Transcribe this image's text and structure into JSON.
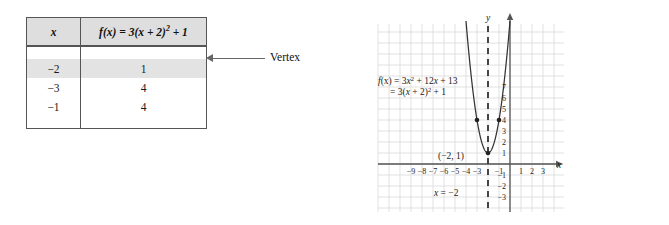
{
  "table_figure": {
    "columns": [
      {
        "label": "x",
        "italic": true
      },
      {
        "label": "f(x) = 3(x + 2)2 + 1",
        "italic": false
      }
    ],
    "header_x": "x",
    "header_fx_f": "f",
    "header_fx_paren_x": "(x)",
    "header_fx_eq": " = 3(",
    "header_fx_var": "x",
    "header_fx_tail": " + 2)",
    "header_fx_exp": "2",
    "header_fx_end": " + 1",
    "rows": [
      {
        "x": "−2",
        "fx": "1",
        "highlight": true
      },
      {
        "x": "−3",
        "fx": "4",
        "highlight": false
      },
      {
        "x": "−1",
        "fx": "4",
        "highlight": false
      }
    ]
  },
  "vertex_callout": {
    "label": "Vertex"
  },
  "chart_data": {
    "type": "line",
    "title": "",
    "xlabel": "x",
    "ylabel": "y",
    "function_label_line1_f": "f",
    "function_label_line1_px": "(x)",
    "function_label_line1_eq": " = 3",
    "function_label_line1_x": "x",
    "function_label_line1_exp": "2",
    "function_label_line1_tail": " + 12",
    "function_label_line1_x2": "x",
    "function_label_line1_end": " + 13",
    "function_label_line2_eq": "= 3(",
    "function_label_line2_x": "x",
    "function_label_line2_tail": " + 2)",
    "function_label_line2_exp": "2",
    "function_label_line2_end": " + 1",
    "equation_standard": "f(x) = 3x2 + 12x + 13",
    "equation_vertex_form": "= 3(x + 2)2 + 1",
    "axis_of_symmetry_label_x": "x",
    "axis_of_symmetry_label_eq": " = −2",
    "axis_of_symmetry_value": -2,
    "vertex_label": "(−2, 1)",
    "vertex": {
      "x": -2,
      "y": 1
    },
    "xlim": [
      -10,
      4
    ],
    "ylim": [
      -4,
      9
    ],
    "grid": true,
    "xticks": [
      -9,
      -8,
      -7,
      -6,
      -5,
      -4,
      -3,
      -1,
      1,
      2,
      3
    ],
    "xtick_labels": [
      "−9",
      "−8",
      "−7",
      "−6",
      "−5",
      "−4",
      "−3",
      "−1",
      "1",
      "2",
      "3"
    ],
    "yticks": [
      7,
      6,
      5,
      4,
      3,
      2,
      1,
      -1,
      -2,
      -3
    ],
    "ytick_labels": [
      "7",
      "6",
      "5",
      "4",
      "3",
      "2",
      "1",
      "−1",
      "−2",
      "−3"
    ],
    "points": [
      {
        "x": -3,
        "y": 4
      },
      {
        "x": -2,
        "y": 1
      },
      {
        "x": -1,
        "y": 4
      }
    ],
    "curve_coefficients": {
      "a": 3,
      "h": -2,
      "k": 1
    },
    "colors": {
      "curve": "#333333",
      "axis": "#555555",
      "grid": "#d9d9d9",
      "point": "#222222",
      "dashed_line": "#333333"
    }
  }
}
